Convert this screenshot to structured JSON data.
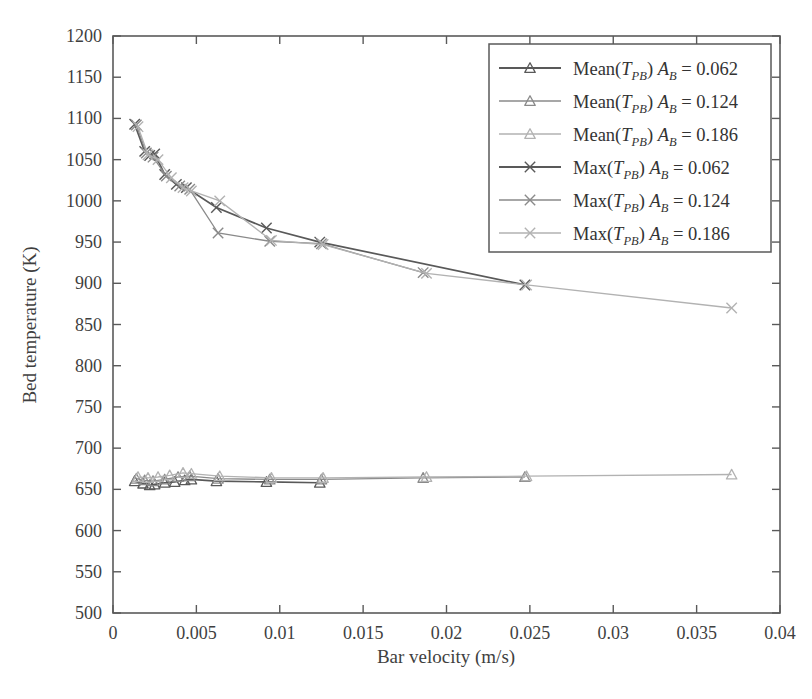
{
  "chart_data": {
    "type": "line",
    "title": "",
    "xlabel": "Bar velocity (m/s)",
    "ylabel": "Bed temperature (K)",
    "xlim": [
      0,
      0.04
    ],
    "ylim": [
      500,
      1200
    ],
    "xticks": [
      0,
      0.005,
      0.01,
      0.015,
      0.02,
      0.025,
      0.03,
      0.035,
      0.04
    ],
    "xticklabels": [
      "0",
      "0.005",
      "0.01",
      "0.015",
      "0.02",
      "0.025",
      "0.03",
      "0.035",
      "0.04"
    ],
    "yticks": [
      500,
      550,
      600,
      650,
      700,
      750,
      800,
      850,
      900,
      950,
      1000,
      1050,
      1100,
      1150,
      1200
    ],
    "yticklabels": [
      "500",
      "550",
      "600",
      "650",
      "700",
      "750",
      "800",
      "850",
      "900",
      "950",
      "1000",
      "1050",
      "1100",
      "1150",
      "1200"
    ],
    "grid": false,
    "legend_position": "upper right",
    "series": [
      {
        "name": "Mean(T_PB) A_B = 0.062",
        "label_prefix": "Mean(",
        "label_var": "T",
        "label_sub": "PB",
        "label_mid": ") ",
        "label_amp": "A",
        "label_amp_sub": "B",
        "label_value": "= 0.062",
        "marker": "triangle",
        "color": "#595959",
        "x": [
          0.0013,
          0.0018,
          0.0022,
          0.0025,
          0.0031,
          0.0037,
          0.0043,
          0.0047,
          0.0062,
          0.0092,
          0.0124
        ],
        "y": [
          660,
          657,
          655,
          656,
          658,
          659,
          661,
          662,
          660,
          659,
          658
        ]
      },
      {
        "name": "Mean(T_PB) A_B = 0.124",
        "label_prefix": "Mean(",
        "label_var": "T",
        "label_sub": "PB",
        "label_mid": ") ",
        "label_amp": "A",
        "label_amp_sub": "B",
        "label_value": "= 0.124",
        "marker": "triangle",
        "color": "#8a8a8a",
        "x": [
          0.0014,
          0.0019,
          0.0024,
          0.0031,
          0.0039,
          0.0046,
          0.0063,
          0.0094,
          0.0125,
          0.0186,
          0.0247
        ],
        "y": [
          663,
          661,
          660,
          662,
          665,
          666,
          663,
          662,
          662,
          664,
          665
        ]
      },
      {
        "name": "Mean(T_PB) A_B = 0.186",
        "label_prefix": "Mean(",
        "label_var": "T",
        "label_sub": "PB",
        "label_mid": ") ",
        "label_amp": "A",
        "label_amp_sub": "B",
        "label_value": "= 0.186",
        "marker": "triangle",
        "color": "#b2b2b2",
        "x": [
          0.0015,
          0.0021,
          0.0027,
          0.0034,
          0.0042,
          0.0047,
          0.0064,
          0.0095,
          0.0126,
          0.0188,
          0.0248,
          0.0371
        ],
        "y": [
          665,
          664,
          665,
          667,
          670,
          669,
          666,
          664,
          664,
          665,
          666,
          668
        ]
      },
      {
        "name": "Max(T_PB) A_B = 0.062",
        "label_prefix": "Max(",
        "label_var": "T",
        "label_sub": "PB",
        "label_mid": ") ",
        "label_amp": "A",
        "label_amp_sub": "B",
        "label_value": "= 0.062",
        "marker": "cross",
        "color": "#595959",
        "x": [
          0.0013,
          0.0019,
          0.0022,
          0.0025,
          0.0031,
          0.0038,
          0.0044,
          0.0062,
          0.0092,
          0.0124,
          0.0247
        ],
        "y": [
          1093,
          1060,
          1055,
          1057,
          1032,
          1020,
          1016,
          992,
          967,
          950,
          898
        ]
      },
      {
        "name": "Max(T_PB) A_B = 0.124",
        "label_prefix": "Max(",
        "label_var": "T",
        "label_sub": "PB",
        "label_mid": ") ",
        "label_amp": "A",
        "label_amp_sub": "B",
        "label_value": "= 0.124",
        "marker": "cross",
        "color": "#8a8a8a",
        "x": [
          0.0014,
          0.002,
          0.0024,
          0.0032,
          0.004,
          0.0046,
          0.0063,
          0.0094,
          0.0125,
          0.0186
        ],
        "y": [
          1092,
          1058,
          1053,
          1030,
          1018,
          1014,
          961,
          951,
          948,
          913
        ]
      },
      {
        "name": "Max(T_PB) A_B = 0.186",
        "label_prefix": "Max(",
        "label_var": "T",
        "label_sub": "PB",
        "label_mid": ") ",
        "label_amp": "A",
        "label_amp_sub": "B",
        "label_value": "= 0.186",
        "marker": "cross",
        "color": "#b2b2b2",
        "x": [
          0.0015,
          0.0021,
          0.0027,
          0.0035,
          0.0042,
          0.0047,
          0.0064,
          0.0095,
          0.0126,
          0.0188,
          0.0248,
          0.0371
        ],
        "y": [
          1090,
          1056,
          1050,
          1028,
          1016,
          1012,
          1000,
          952,
          947,
          912,
          898,
          870
        ]
      }
    ]
  },
  "colors": {
    "dark": "#595959",
    "medium": "#8a8a8a",
    "light": "#b2b2b2",
    "axis": "#5a5a5a",
    "text": "#3f3f3f",
    "background": "#ffffff"
  }
}
